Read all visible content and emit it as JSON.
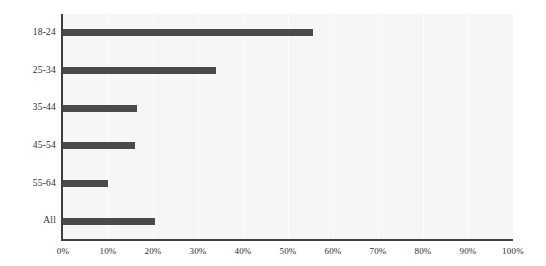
{
  "chart_data": {
    "type": "bar",
    "orientation": "horizontal",
    "title": "",
    "subtitle": "",
    "xlabel": "",
    "ylabel": "",
    "categories": [
      "18-24",
      "25-34",
      "35-44",
      "45-54",
      "55-64",
      "All"
    ],
    "values": [
      55.5,
      34,
      16.5,
      16,
      10,
      20.5
    ],
    "value_suffix": "%",
    "xlim": [
      0,
      100
    ],
    "xticks": [
      0,
      10,
      20,
      30,
      40,
      50,
      60,
      70,
      80,
      90,
      100
    ],
    "xtick_labels": [
      "0%",
      "10%",
      "20%",
      "30%",
      "40%",
      "50%",
      "60%",
      "70%",
      "80%",
      "90%",
      "100%"
    ],
    "grid": {
      "vertical": true,
      "horizontal": false,
      "color": "#fdfdfd"
    },
    "legend": {
      "visible": false,
      "position": "none",
      "entries": []
    },
    "series": [
      {
        "name": "Share",
        "color": "#4a4a4a",
        "values": [
          55.5,
          34,
          16.5,
          16,
          10,
          20.5
        ]
      }
    ],
    "annotations": []
  },
  "style": {
    "plot_background": "#f6f6f6",
    "page_background": "#ffffff",
    "axis_color": "#3f3f3f",
    "bar_color": "#4a4a4a",
    "label_color": "#2e2e2e"
  }
}
